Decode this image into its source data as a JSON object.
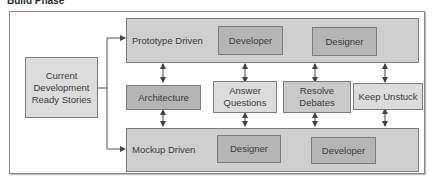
{
  "title": "Build Phase",
  "source": {
    "label": "Current Development Ready Stories",
    "lines": [
      "Current",
      "Development",
      "Ready Stories"
    ]
  },
  "prototype": {
    "label": "Prototype Driven",
    "steps": [
      "Developer",
      "Designer"
    ]
  },
  "activities": [
    {
      "lines": [
        "Architecture"
      ]
    },
    {
      "lines": [
        "Answer",
        "Questions"
      ]
    },
    {
      "lines": [
        "Resolve",
        "Debates"
      ]
    },
    {
      "lines": [
        "Keep Unstuck"
      ]
    }
  ],
  "mockup": {
    "label": "Mockup Driven",
    "steps": [
      "Designer",
      "Developer"
    ]
  },
  "colors": {
    "container": "#cfcfcf",
    "step_box": "#b8b8b8",
    "activity_dark": "#b5b5b5",
    "activity_light": "#dcdcdc",
    "border": "#7c7c7c",
    "line": "#555555"
  }
}
